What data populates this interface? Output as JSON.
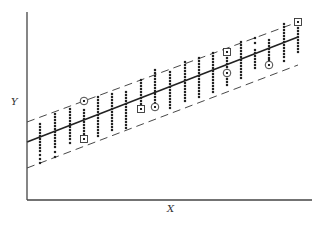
{
  "chart_data": {
    "type": "scatter",
    "title": "",
    "xlabel": "X",
    "ylabel": "Y",
    "grid": false,
    "legend": null,
    "axes": {
      "x_pixel_range": [
        27,
        312
      ],
      "y_pixel_range": [
        200,
        12
      ],
      "ticks": "none"
    },
    "colors": {
      "points": "#222222",
      "axis": "#444444",
      "regression_line": "#222222",
      "band_lines": "#333333",
      "background": "#ffffff"
    },
    "columns": [
      {
        "x": 40,
        "ys": [
          124,
          127,
          130,
          133,
          136,
          139,
          142,
          145,
          148,
          151,
          155,
          159,
          163
        ]
      },
      {
        "x": 55,
        "ys": [
          114,
          117,
          120,
          123,
          126,
          129,
          132,
          135,
          138,
          141,
          144,
          147,
          152,
          157
        ]
      },
      {
        "x": 70,
        "ys": [
          109,
          112,
          115,
          118,
          121,
          124,
          127,
          130,
          133,
          136,
          139,
          143
        ]
      },
      {
        "x": 84,
        "ys": [
          110,
          113,
          116,
          119,
          122,
          125,
          128,
          131,
          134
        ]
      },
      {
        "x": 98,
        "ys": [
          97,
          100,
          103,
          106,
          109,
          112,
          115,
          118,
          121,
          124,
          127,
          130,
          133,
          136
        ]
      },
      {
        "x": 112,
        "ys": [
          94,
          97,
          100,
          103,
          106,
          109,
          112,
          115,
          118,
          121,
          124,
          127,
          130
        ]
      },
      {
        "x": 126,
        "ys": [
          92,
          95,
          98,
          101,
          104,
          107,
          110,
          113,
          116,
          119,
          122,
          125,
          128
        ]
      },
      {
        "x": 141,
        "ys": [
          80,
          83,
          86,
          89,
          92,
          95,
          98,
          101,
          104
        ]
      },
      {
        "x": 155,
        "ys": [
          70,
          73,
          76,
          79,
          82,
          85,
          88,
          91,
          94,
          97,
          100,
          103
        ]
      },
      {
        "x": 170,
        "ys": [
          72,
          75,
          78,
          81,
          84,
          87,
          90,
          93,
          96,
          99,
          102,
          105,
          108
        ]
      },
      {
        "x": 185,
        "ys": [
          62,
          65,
          68,
          71,
          74,
          77,
          80,
          83,
          86,
          89,
          92,
          95,
          98,
          101
        ]
      },
      {
        "x": 199,
        "ys": [
          58,
          61,
          64,
          67,
          70,
          73,
          76,
          79,
          82,
          85,
          88,
          91,
          94,
          97
        ]
      },
      {
        "x": 213,
        "ys": [
          53,
          56,
          59,
          62,
          65,
          68,
          71,
          74,
          77,
          80,
          83,
          86,
          89,
          92
        ]
      },
      {
        "x": 227,
        "ys": [
          58,
          61,
          64,
          67,
          70,
          76,
          79,
          82,
          85
        ]
      },
      {
        "x": 241,
        "ys": [
          42,
          45,
          48,
          51,
          54,
          57,
          60,
          63,
          66,
          69,
          72,
          75,
          78
        ]
      },
      {
        "x": 255,
        "ys": [
          38,
          43,
          50,
          53,
          56,
          59,
          62,
          65,
          68
        ]
      },
      {
        "x": 269,
        "ys": [
          40,
          43,
          46,
          49,
          52,
          55,
          58,
          60
        ]
      },
      {
        "x": 284,
        "ys": [
          24,
          27,
          30,
          33,
          36,
          39,
          42,
          45,
          48,
          51,
          54,
          57,
          61
        ]
      },
      {
        "x": 298,
        "ys": [
          28,
          31,
          34,
          37,
          40,
          43,
          46,
          49,
          52
        ]
      }
    ],
    "boxed_points": [
      {
        "x": 84,
        "y": 139
      },
      {
        "x": 141,
        "y": 109
      },
      {
        "x": 227,
        "y": 52
      },
      {
        "x": 298,
        "y": 22
      }
    ],
    "circled_points": [
      {
        "x": 84,
        "y": 101
      },
      {
        "x": 155,
        "y": 107
      },
      {
        "x": 227,
        "y": 73
      },
      {
        "x": 269,
        "y": 65
      }
    ],
    "lines": [
      {
        "name": "regression",
        "style": "solid",
        "from": [
          27,
          142
        ],
        "to": [
          298,
          37
        ]
      },
      {
        "name": "upper-band",
        "style": "dashed",
        "from": [
          27,
          122
        ],
        "to": [
          298,
          22
        ]
      },
      {
        "name": "lower-band",
        "style": "dashed",
        "from": [
          27,
          168
        ],
        "to": [
          298,
          65
        ]
      }
    ]
  }
}
